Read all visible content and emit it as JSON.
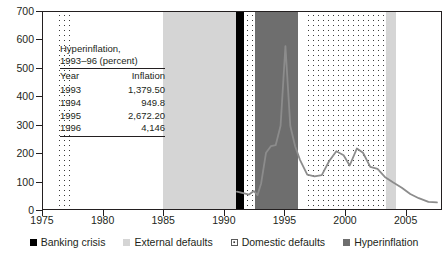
{
  "chart_data": {
    "type": "line",
    "title": "",
    "subtitle": "",
    "xlabel": "",
    "ylabel": "",
    "xlim": [
      1975,
      2008
    ],
    "ylim": [
      0,
      700
    ],
    "grid": false,
    "y_ticks": [
      0,
      100,
      200,
      300,
      400,
      500,
      600,
      700
    ],
    "x_ticks": [
      1975,
      1980,
      1985,
      1990,
      1995,
      2000,
      2005
    ],
    "legend_position": "bottom-center",
    "series": [
      {
        "name": "inflation",
        "color": "#8c8c8c",
        "x": [
          1991.0,
          1991.6,
          1992.0,
          1992.4,
          1992.7,
          1993.0,
          1993.4,
          1993.8,
          1994.2,
          1994.6,
          1995.0,
          1995.4,
          1995.8,
          1996.2,
          1996.8,
          1997.4,
          1998.0,
          1998.6,
          1999.2,
          1999.8,
          2000.3,
          2000.9,
          2001.4,
          2002.0,
          2002.6,
          2003.2,
          2003.9,
          2004.6,
          2005.3,
          2006.0,
          2006.8,
          2007.5
        ],
        "y": [
          68,
          62,
          58,
          70,
          56,
          98,
          205,
          228,
          232,
          300,
          580,
          300,
          228,
          180,
          128,
          122,
          126,
          175,
          210,
          196,
          160,
          220,
          205,
          155,
          148,
          120,
          100,
          82,
          60,
          45,
          32,
          30
        ]
      }
    ],
    "bands": [
      {
        "label": "Domestic defaults",
        "type": "domestic",
        "start": 1976.1,
        "end": 1977.3
      },
      {
        "label": "External defaults",
        "type": "external",
        "start": 1984.9,
        "end": 1990.9
      },
      {
        "label": "Banking crisis",
        "type": "banking",
        "start": 1990.9,
        "end": 1991.6
      },
      {
        "label": "Domestic defaults",
        "type": "domestic",
        "start": 1991.6,
        "end": 1992.5
      },
      {
        "label": "Hyperinflation",
        "type": "hyper",
        "start": 1992.5,
        "end": 1996.0
      },
      {
        "label": "Domestic defaults",
        "type": "domestic",
        "start": 1996.6,
        "end": 2003.3
      },
      {
        "label": "External defaults",
        "type": "external",
        "start": 2003.3,
        "end": 2004.1
      }
    ],
    "colors": {
      "banking": "#000000",
      "external": "#d5d5d5",
      "domestic": "#ffffff",
      "hyperinflation": "#6e6e6e",
      "line": "#8c8c8c",
      "axis": "#231f20"
    }
  },
  "annotation_table": {
    "title_line1": "Hyperinflation,",
    "title_line2": "1993–96 (percent)",
    "columns": [
      "Year",
      "Inflation"
    ],
    "rows": [
      {
        "year": "1993",
        "inflation": "1,379.50"
      },
      {
        "year": "1994",
        "inflation": "949.8"
      },
      {
        "year": "1995",
        "inflation": "2,672.20"
      },
      {
        "year": "1996",
        "inflation": "4,146"
      }
    ]
  },
  "legend": {
    "items": [
      {
        "label": "Banking crisis",
        "swatch": "banking-swatch"
      },
      {
        "label": "External defaults",
        "swatch": "external-swatch"
      },
      {
        "label": "Domestic defaults",
        "swatch": "domestic-swatch"
      },
      {
        "label": "Hyperinflation",
        "swatch": "hyperinflation-swatch"
      }
    ]
  },
  "axis_labels": {
    "y": [
      "700",
      "600",
      "500",
      "400",
      "300",
      "200",
      "100",
      "0"
    ],
    "x": [
      "1975",
      "1980",
      "1985",
      "1990",
      "1995",
      "2000",
      "2005"
    ]
  }
}
